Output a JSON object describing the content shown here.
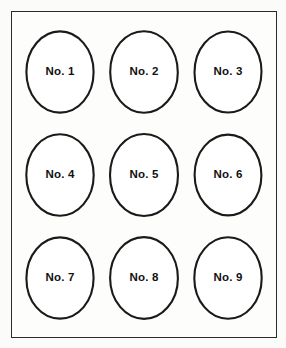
{
  "figure": {
    "background_color": "#fbfbf9",
    "frame": {
      "border_color": "#2b2b2b",
      "fill_color": "#fdfdfc"
    },
    "shape_style": {
      "outline_color": "#1a1a1a",
      "fill_color": "#ffffff",
      "shape": "ellipse"
    },
    "label_color": "#111111",
    "grid": {
      "rows": 3,
      "columns": 3
    },
    "cells": [
      {
        "label": "No. 1",
        "row": 1,
        "column": 1
      },
      {
        "label": "No. 2",
        "row": 1,
        "column": 2
      },
      {
        "label": "No. 3",
        "row": 1,
        "column": 3
      },
      {
        "label": "No. 4",
        "row": 2,
        "column": 1
      },
      {
        "label": "No. 5",
        "row": 2,
        "column": 2
      },
      {
        "label": "No. 6",
        "row": 2,
        "column": 3
      },
      {
        "label": "No. 7",
        "row": 3,
        "column": 1
      },
      {
        "label": "No. 8",
        "row": 3,
        "column": 2
      },
      {
        "label": "No. 9",
        "row": 3,
        "column": 3
      }
    ]
  }
}
